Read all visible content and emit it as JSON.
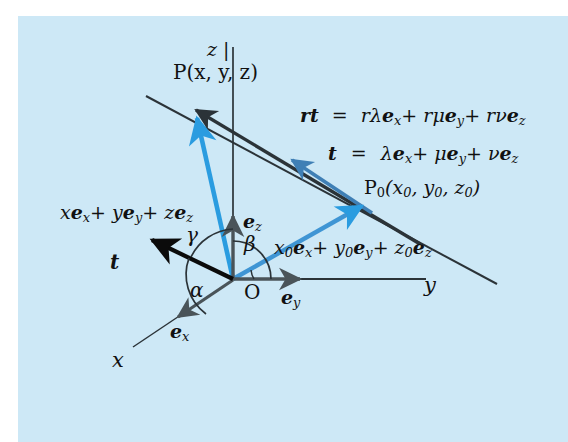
{
  "figure": {
    "type": "vector-geometry-diagram",
    "background_color": "#cde8f6",
    "page_color": "#ffffff",
    "axes": {
      "z_label": "z |",
      "y_label": "y",
      "x_label": "x",
      "origin_label": "O"
    },
    "basis_vectors": [
      {
        "name": "e-z",
        "label_base": "e",
        "label_sub": "z",
        "color": "#3f4a52"
      },
      {
        "name": "e-y",
        "label_base": "e",
        "label_sub": "y",
        "color": "#3f4a52"
      },
      {
        "name": "e-x",
        "label_base": "e",
        "label_sub": "x",
        "color": "#3f4a52"
      }
    ],
    "points": {
      "P": "P(x, y, z)",
      "P0_base": "P",
      "P0_sub": "0",
      "P0_coords": "(x₀, y₀, z₀)"
    },
    "angles": [
      {
        "name": "alpha",
        "glyph": "α"
      },
      {
        "name": "beta",
        "glyph": "β"
      },
      {
        "name": "gamma",
        "glyph": "γ"
      }
    ],
    "equations": {
      "rt_lhs": "rt",
      "rt_eq": "=",
      "rt_rhs": "rλeₓ + rμeᵧ + rνeᵩ",
      "t_lhs": "t",
      "t_eq": "=",
      "t_rhs": "λeₓ + μeᵧ + νeᵩ"
    },
    "vector_labels": {
      "position_P": "xeₓ + yeᵧ + zeᵩ",
      "position_P0": "x₀eₓ + y₀eᵧ + z₀eᵩ",
      "t_black": "t",
      "t_blue": "t"
    },
    "colors": {
      "bright_blue": "#2a9ce0",
      "medium_blue": "#3f7fb5",
      "dark_ink": "#2b3338",
      "black": "#0b0b0b",
      "axis_gray": "#4a5459"
    }
  }
}
